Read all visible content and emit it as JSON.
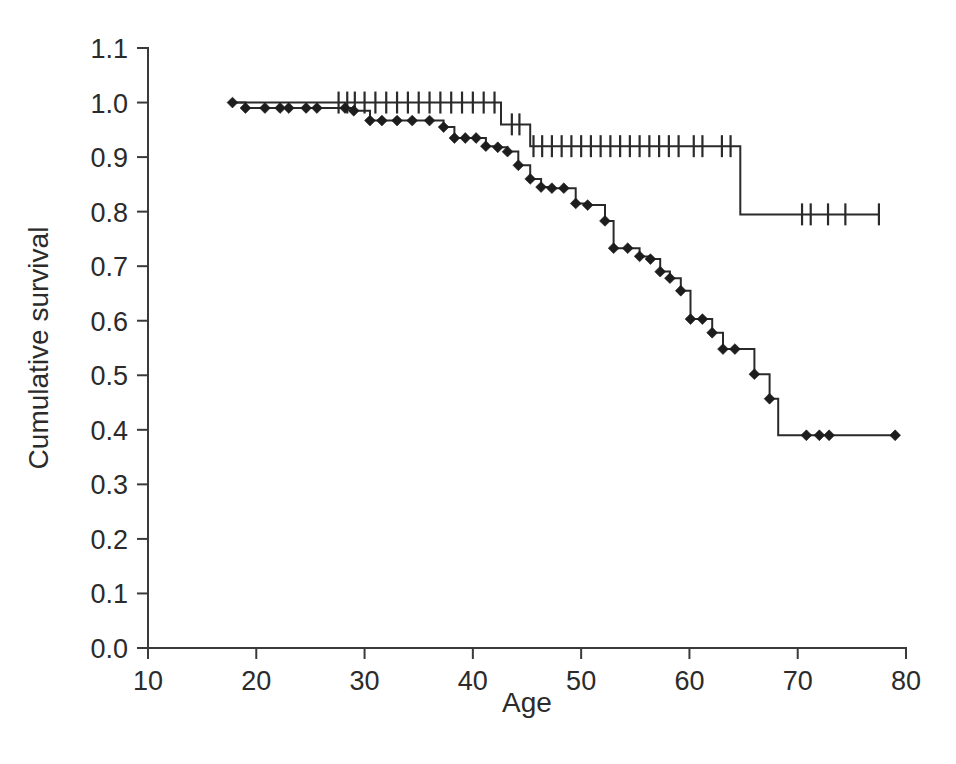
{
  "figure": {
    "background_color": "#ffffff",
    "ink_color": "#2a2a2a"
  },
  "chart_data": {
    "type": "line",
    "plot_kind": "kaplan-meier-survival",
    "title": "",
    "subtitle": "",
    "xlabel": "Age",
    "ylabel": "Cumulative survival",
    "xlim": [
      10,
      80
    ],
    "ylim": [
      0.0,
      1.1
    ],
    "xticks": [
      10,
      20,
      30,
      40,
      50,
      60,
      70,
      80
    ],
    "xticklabels": [
      "10",
      "20",
      "30",
      "40",
      "50",
      "60",
      "70",
      "80"
    ],
    "yticks": [
      0.0,
      0.1,
      0.2,
      0.3,
      0.4,
      0.5,
      0.6,
      0.7,
      0.8,
      0.9,
      1.0,
      1.1
    ],
    "yticklabels": [
      "0.0",
      "0.1",
      "0.2",
      "0.3",
      "0.4",
      "0.5",
      "0.6",
      "0.7",
      "0.8",
      "0.9",
      "1.0",
      "1.1"
    ],
    "grid": false,
    "legend": false,
    "legend_position": "none",
    "annotations": [],
    "series": [
      {
        "name": "upper-curve",
        "marker": "plus",
        "x": [
          17.8,
          27.6,
          28.4,
          29.1,
          30.0,
          31.0,
          32.0,
          33.0,
          34.0,
          35.0,
          36.0,
          37.0,
          38.0,
          39.0,
          40.0,
          41.0,
          42.0,
          42.6,
          44.6,
          45.3,
          46.2,
          47.1,
          48.0,
          49.0,
          50.0,
          51.0,
          52.0,
          53.0,
          54.0,
          55.0,
          56.0,
          57.0,
          58.0,
          59.0,
          60.0,
          61.0,
          62.0,
          63.0,
          64.0,
          64.7,
          70.4,
          71.2,
          72.8,
          74.4,
          77.5
        ],
        "y": [
          1.0,
          1.0,
          1.0,
          1.0,
          1.0,
          1.0,
          1.0,
          1.0,
          1.0,
          1.0,
          1.0,
          1.0,
          1.0,
          1.0,
          1.0,
          1.0,
          1.0,
          0.96,
          0.96,
          0.92,
          0.92,
          0.92,
          0.92,
          0.92,
          0.92,
          0.92,
          0.92,
          0.92,
          0.92,
          0.92,
          0.92,
          0.92,
          0.92,
          0.92,
          0.92,
          0.92,
          0.92,
          0.92,
          0.92,
          0.795,
          0.795,
          0.795,
          0.795,
          0.795,
          0.795
        ],
        "censor_x": [
          27.6,
          28.4,
          29.1,
          30.0,
          31.0,
          32.0,
          33.0,
          34.0,
          35.0,
          36.0,
          37.0,
          38.0,
          39.0,
          40.0,
          41.0,
          42.0,
          43.6,
          44.3,
          45.6,
          46.4,
          47.3,
          48.2,
          49.1,
          50.0,
          50.9,
          51.8,
          52.7,
          53.6,
          54.5,
          55.4,
          56.3,
          57.2,
          58.1,
          59.0,
          60.4,
          61.2,
          63.0,
          63.8,
          70.4,
          71.2,
          72.8,
          74.4,
          77.5
        ],
        "censor_y": [
          1.0,
          1.0,
          1.0,
          1.0,
          1.0,
          1.0,
          1.0,
          1.0,
          1.0,
          1.0,
          1.0,
          1.0,
          1.0,
          1.0,
          1.0,
          1.0,
          0.96,
          0.96,
          0.92,
          0.92,
          0.92,
          0.92,
          0.92,
          0.92,
          0.92,
          0.92,
          0.92,
          0.92,
          0.92,
          0.92,
          0.92,
          0.92,
          0.92,
          0.92,
          0.92,
          0.92,
          0.92,
          0.92,
          0.795,
          0.795,
          0.795,
          0.795,
          0.795
        ]
      },
      {
        "name": "lower-curve",
        "marker": "diamond",
        "x": [
          17.8,
          19.0,
          20.8,
          22.2,
          23.0,
          24.6,
          25.6,
          28.2,
          29.0,
          30.5,
          31.6,
          33.0,
          34.4,
          36.0,
          37.3,
          38.3,
          39.3,
          40.3,
          41.2,
          42.3,
          43.2,
          44.2,
          45.3,
          46.3,
          47.3,
          48.4,
          49.5,
          50.6,
          52.2,
          53.0,
          54.3,
          55.4,
          56.4,
          57.3,
          58.2,
          59.2,
          60.1,
          61.2,
          62.1,
          63.1,
          64.2,
          65.0,
          66.0,
          67.4,
          68.2,
          70.8,
          72.0,
          72.9,
          79.0
        ],
        "y": [
          1.0,
          0.99,
          0.99,
          0.99,
          0.99,
          0.99,
          0.99,
          0.99,
          0.985,
          0.967,
          0.967,
          0.967,
          0.967,
          0.967,
          0.955,
          0.935,
          0.935,
          0.935,
          0.92,
          0.918,
          0.91,
          0.885,
          0.86,
          0.845,
          0.843,
          0.843,
          0.815,
          0.812,
          0.783,
          0.733,
          0.733,
          0.718,
          0.713,
          0.69,
          0.678,
          0.655,
          0.603,
          0.603,
          0.578,
          0.548,
          0.548,
          0.548,
          0.502,
          0.457,
          0.39,
          0.39,
          0.39,
          0.39,
          0.39
        ],
        "censor_x": [
          17.8,
          19.0,
          20.8,
          22.2,
          23.0,
          24.6,
          25.6,
          28.2,
          29.0,
          30.5,
          31.6,
          33.0,
          34.4,
          36.0,
          37.3,
          38.3,
          39.3,
          40.3,
          41.2,
          42.3,
          43.2,
          44.2,
          45.3,
          46.3,
          47.3,
          48.4,
          49.5,
          50.6,
          52.2,
          53.0,
          54.3,
          55.4,
          56.4,
          57.3,
          58.2,
          59.2,
          60.1,
          61.2,
          62.1,
          63.1,
          64.2,
          66.0,
          67.4,
          70.8,
          72.0,
          72.9,
          79.0
        ],
        "censor_y": [
          1.0,
          0.99,
          0.99,
          0.99,
          0.99,
          0.99,
          0.99,
          0.99,
          0.985,
          0.967,
          0.967,
          0.967,
          0.967,
          0.967,
          0.955,
          0.935,
          0.935,
          0.935,
          0.92,
          0.918,
          0.91,
          0.885,
          0.86,
          0.845,
          0.843,
          0.843,
          0.815,
          0.812,
          0.783,
          0.733,
          0.733,
          0.718,
          0.713,
          0.69,
          0.678,
          0.655,
          0.603,
          0.603,
          0.578,
          0.548,
          0.548,
          0.502,
          0.457,
          0.39,
          0.39,
          0.39,
          0.39
        ]
      }
    ]
  }
}
